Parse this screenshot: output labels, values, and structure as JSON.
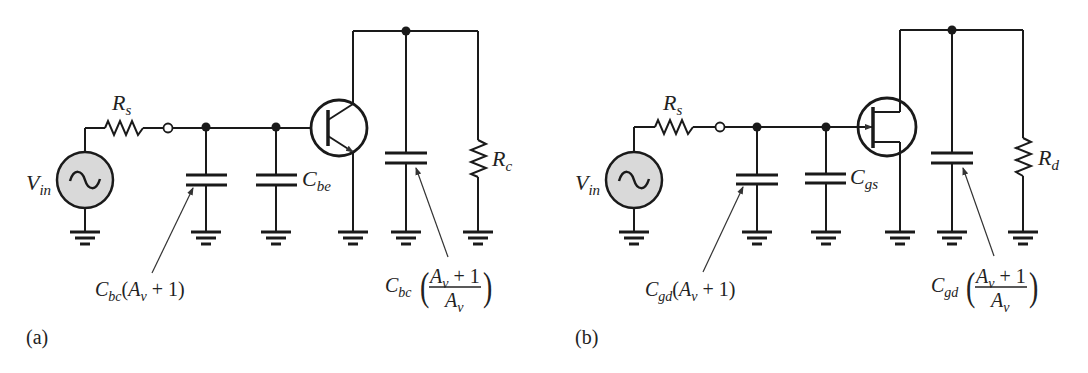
{
  "figure": {
    "panels": [
      {
        "id": "a",
        "caption": "(a)",
        "device": "BJT",
        "labels": {
          "source": "V",
          "source_sub": "in",
          "rs": "R",
          "rs_sub": "s",
          "c_internal": "C",
          "c_internal_sub": "be",
          "load": "R",
          "load_sub": "c",
          "miller_in_C": "C",
          "miller_in_sub": "bc",
          "miller_in_expr_open": "(A",
          "miller_in_expr_v": "v",
          "miller_in_expr_close": " + 1)",
          "miller_out_C": "C",
          "miller_out_sub": "bc",
          "miller_out_num_A": "A",
          "miller_out_num_v": "v",
          "miller_out_num_rest": " + 1",
          "miller_out_den_A": "A",
          "miller_out_den_v": "v"
        }
      },
      {
        "id": "b",
        "caption": "(b)",
        "device": "JFET",
        "labels": {
          "source": "V",
          "source_sub": "in",
          "rs": "R",
          "rs_sub": "s",
          "c_internal": "C",
          "c_internal_sub": "gs",
          "load": "R",
          "load_sub": "d",
          "miller_in_C": "C",
          "miller_in_sub": "gd",
          "miller_in_expr_open": "(A",
          "miller_in_expr_v": "v",
          "miller_in_expr_close": " + 1)",
          "miller_out_C": "C",
          "miller_out_sub": "gd",
          "miller_out_num_A": "A",
          "miller_out_num_v": "v",
          "miller_out_num_rest": " + 1",
          "miller_out_den_A": "A",
          "miller_out_den_v": "v"
        }
      }
    ],
    "colors": {
      "wire": "#1a1a1a",
      "source_fill": "#d9d9d9",
      "text": "#222222"
    }
  }
}
